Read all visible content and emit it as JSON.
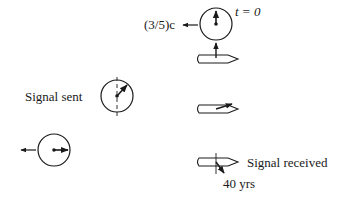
{
  "diagram": {
    "type": "relativity-clock-diagram",
    "labels": {
      "speed": "(3/5)c",
      "time_zero": "t = 0",
      "signal_sent": "Signal sent",
      "signal_received": "Signal received",
      "elapsed": "40 yrs"
    },
    "clocks": [
      {
        "id": "clock-top",
        "hand": "up",
        "note": "t = 0, moving left at (3/5)c"
      },
      {
        "id": "clock-signal-sent",
        "hand": "up-right",
        "note": "Signal sent"
      },
      {
        "id": "clock-bottom-left",
        "hand": "right",
        "note": "moving left"
      }
    ],
    "ships": [
      {
        "id": "ship-top",
        "hand": "up"
      },
      {
        "id": "ship-middle",
        "hand": "up-right"
      },
      {
        "id": "ship-bottom",
        "hand": "down-right",
        "note": "Signal received, 40 yrs"
      }
    ],
    "colors": {
      "ink": "#1a1a1a",
      "background": "#ffffff"
    }
  }
}
